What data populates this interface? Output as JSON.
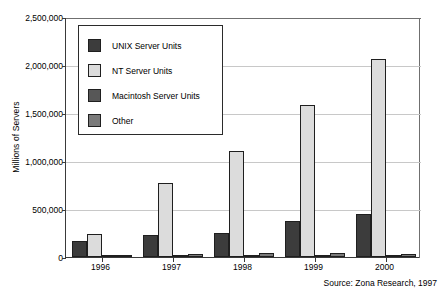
{
  "chart_data": {
    "type": "bar",
    "title": "",
    "subtitle": "",
    "xlabel": "",
    "ylabel": "Millions of Servers",
    "categories": [
      "1996",
      "1997",
      "1998",
      "1999",
      "2000"
    ],
    "series": [
      {
        "name": "UNIX Server Units",
        "color": "#3c3c3c",
        "values": [
          165000,
          230000,
          255000,
          380000,
          450000
        ]
      },
      {
        "name": "NT Server Units",
        "color": "#dcdcdc",
        "values": [
          240000,
          770000,
          1100000,
          1580000,
          2060000
        ]
      },
      {
        "name": "Macintosh Server Units",
        "color": "#575757",
        "values": [
          15000,
          20000,
          22000,
          25000,
          12000
        ]
      },
      {
        "name": "Other",
        "color": "#7a7a7a",
        "values": [
          22000,
          30000,
          42000,
          45000,
          28000
        ]
      }
    ],
    "ylim": [
      0,
      2500000
    ],
    "yticks": [
      0,
      500000,
      1000000,
      1500000,
      2000000,
      2500000
    ],
    "ytick_labels": [
      "0",
      "500,000",
      "1,000,000",
      "1,500,000",
      "2,000,000",
      "2,500,000"
    ],
    "grid": true,
    "legend_position": "upper-left-inside",
    "annotations": [
      "Source: Zona Research, 1997"
    ]
  },
  "source_note": "Source: Zona Research, 1997"
}
